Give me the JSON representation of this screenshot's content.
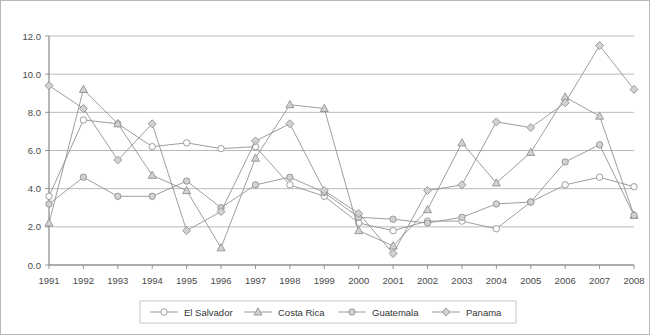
{
  "chart_data": {
    "type": "line",
    "title": "",
    "subtitle": "",
    "xlabel": "",
    "ylabel": "",
    "xlim": [
      1991,
      2008
    ],
    "ylim": [
      0.0,
      12.0
    ],
    "ytick_step": 2.0,
    "grid": true,
    "legend_position": "bottom",
    "categories": [
      "1991",
      "1992",
      "1993",
      "1994",
      "1995",
      "1996",
      "1997",
      "1998",
      "1999",
      "2000",
      "2001",
      "2002",
      "2003",
      "2004",
      "2005",
      "2006",
      "2007",
      "2008"
    ],
    "ytick_labels": [
      "0.0",
      "2.0",
      "4.0",
      "6.0",
      "8.0",
      "10.0",
      "12.0"
    ],
    "ytick_values": [
      0.0,
      2.0,
      4.0,
      6.0,
      8.0,
      10.0,
      12.0
    ],
    "series": [
      {
        "name": "El Salvador",
        "marker": "open-circle",
        "values": [
          3.6,
          7.6,
          7.4,
          6.2,
          6.4,
          6.1,
          6.2,
          4.2,
          3.6,
          2.2,
          1.8,
          2.3,
          2.3,
          1.9,
          3.3,
          4.2,
          4.6,
          4.1
        ]
      },
      {
        "name": "Costa Rica",
        "marker": "triangle",
        "values": [
          2.2,
          9.2,
          7.4,
          4.7,
          3.9,
          0.9,
          5.6,
          8.4,
          8.2,
          1.8,
          1.0,
          2.9,
          6.4,
          4.3,
          5.9,
          8.8,
          7.8,
          2.6
        ]
      },
      {
        "name": "Guatemala",
        "marker": "filled-circle",
        "values": [
          3.2,
          4.6,
          3.6,
          3.6,
          4.4,
          3.0,
          4.2,
          4.6,
          3.8,
          2.5,
          2.4,
          2.2,
          2.5,
          3.2,
          3.3,
          5.4,
          6.3,
          2.6
        ]
      },
      {
        "name": "Panama",
        "marker": "diamond",
        "values": [
          9.4,
          8.2,
          5.5,
          7.4,
          1.8,
          2.8,
          6.5,
          7.4,
          3.9,
          2.7,
          0.6,
          3.9,
          4.2,
          7.5,
          7.2,
          8.5,
          11.5,
          9.2
        ]
      }
    ],
    "colors": {
      "line": "#8d8d8d",
      "grid": "#a8a8a8",
      "axis": "#7d7d7d",
      "marker_open_fill": "#ffffff",
      "marker_filled_fill": "#d2d2d2",
      "text": "#4a4a4a",
      "background": "#ffffff",
      "frame_border": "#b9b9b9"
    }
  }
}
